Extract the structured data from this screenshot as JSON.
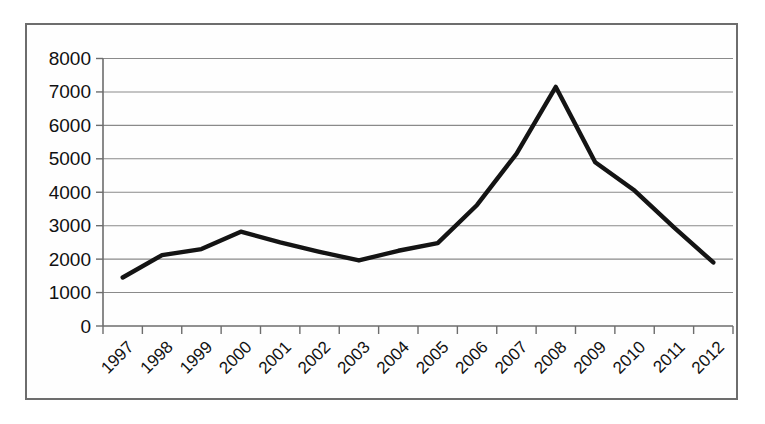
{
  "chart_data": {
    "type": "line",
    "title": "",
    "subtitle": "",
    "xlabel": "",
    "ylabel": "",
    "categories": [
      "1997",
      "1998",
      "1999",
      "2000",
      "2001",
      "2002",
      "2003",
      "2004",
      "2005",
      "2006",
      "2007",
      "2008",
      "2009",
      "2010",
      "2011",
      "2012"
    ],
    "values": [
      1450,
      2120,
      2300,
      2820,
      2500,
      2220,
      1960,
      2250,
      2480,
      3620,
      5150,
      7150,
      4900,
      4050,
      2950,
      1900
    ],
    "series": [
      {
        "name": "",
        "values": [
          1450,
          2120,
          2300,
          2820,
          2500,
          2220,
          1960,
          2250,
          2480,
          3620,
          5150,
          7150,
          4900,
          4050,
          2950,
          1900
        ]
      }
    ],
    "ylim": [
      0,
      8000
    ],
    "ytick_values": [
      0,
      1000,
      2000,
      3000,
      4000,
      5000,
      6000,
      7000,
      8000
    ],
    "ytick_labels": [
      "0",
      "1000",
      "2000",
      "3000",
      "4000",
      "5000",
      "6000",
      "7000",
      "8000"
    ],
    "xtick_labels": [
      "1997",
      "1998",
      "1999",
      "2000",
      "2001",
      "2002",
      "2003",
      "2004",
      "2005",
      "2006",
      "2007",
      "2008",
      "2009",
      "2010",
      "2011",
      "2012"
    ],
    "xtick_rotation": 45,
    "grid": "horizontal",
    "legend": "none",
    "line_color": "#141414",
    "grid_color": "#8a8a8a",
    "axis_color": "#6d6d6d",
    "background_color": "#ffffff"
  },
  "figure": {
    "frame_border_color": "#6d6d6d"
  }
}
